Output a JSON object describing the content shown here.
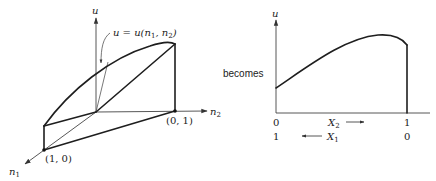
{
  "left_diagram": {
    "axis_u_label": "u",
    "axis_n1_label": "n",
    "axis_n1_sub": "1",
    "axis_n2_label": "n",
    "axis_n2_sub": "2",
    "function_label": "u = u(n",
    "function_label_sub1": "1",
    "function_label_mid": ", n",
    "function_label_sub2": "2",
    "function_label_end": ")",
    "point_01": "(0, 1)",
    "point_10": "(1, 0)"
  },
  "connector_text": "becomes",
  "right_diagram": {
    "axis_u_label": "u",
    "x2_label": "X",
    "x2_sub": "2",
    "x2_arrow": "⟶",
    "x1_label": "X",
    "x1_sub": "1",
    "x1_arrow": "⟵",
    "tick_left_top": "0",
    "tick_right_top": "1",
    "tick_left_bottom": "1",
    "tick_right_bottom": "0"
  },
  "colors": {
    "ink": "#1e1e1e",
    "background": "#ffffff"
  }
}
